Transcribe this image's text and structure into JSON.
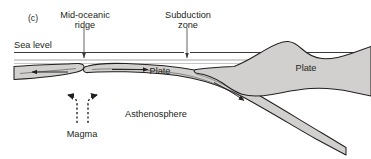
{
  "figure": {
    "panel_label": "(c)",
    "labels": {
      "mid_ocean_ridge_line1": "Mid-oceanic",
      "mid_ocean_ridge_line2": "ridge",
      "subduction_line1": "Subduction",
      "subduction_line2": "zone",
      "sea_level": "Sea level",
      "plate_left": "Plate",
      "plate_right": "Plate",
      "asthenosphere": "Asthenosphere",
      "magma": "Magma"
    },
    "colors": {
      "lithosphere_fill": "#d2d0ce",
      "outline": "#231f20",
      "text": "#231f20",
      "sea_level_line": "#3a3a3a",
      "water_line": "#9a9a9a",
      "background": "#ffffff"
    },
    "elements": {
      "sea_level_line_label": "sea-level-horizontal-line",
      "water_surface_line_label": "water-surface-line",
      "spreading_arrow_left": "left-plate-spreading-arrow",
      "spreading_arrow_right": "right-plate-spreading-arrow",
      "slab_arrow": "subducting-slab-arrow",
      "magma_arrow_left": "magma-upwelling-arrow-left",
      "magma_arrow_right": "magma-upwelling-arrow-right",
      "ridge_pointer": "mid-ocean-ridge-pointer",
      "subduction_pointer": "subduction-zone-pointer"
    }
  }
}
